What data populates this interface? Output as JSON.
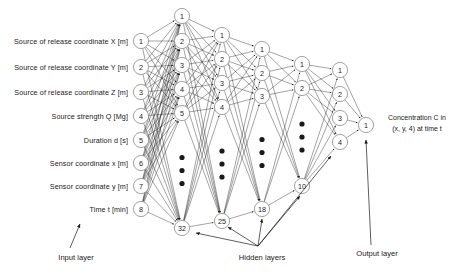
{
  "diagram": {
    "input_labels": [
      "Source of release coordinate X [m]",
      "Source of release coordinate Y [m]",
      "Source of release coordinate Z [m]",
      "Source strength Q [Mg]",
      "Duration d [s]",
      "Sensor coordinate x [m]",
      "Sensor coordinate y [m]",
      "Time t [min]"
    ],
    "output_label_line1": "Concentration C in",
    "output_label_line2": "(x, y, 4) at time t",
    "layer_captions": {
      "input": "Input layer",
      "hidden": "Hidden layers",
      "output": "Output layer"
    },
    "layers": [
      {
        "name": "input-layer",
        "x": 141,
        "node_labels": [
          "1",
          "2",
          "3",
          "4",
          "5",
          "6",
          "7",
          "8"
        ],
        "ellipsis": false,
        "ys": [
          41,
          67,
          92,
          116,
          140,
          163,
          186,
          209
        ]
      },
      {
        "name": "hidden-layer-1",
        "x": 182,
        "node_labels": [
          "1",
          "2",
          "3",
          "4",
          "5",
          "32"
        ],
        "ellipsis": true,
        "ys": [
          16,
          41,
          65,
          89,
          113,
          228
        ]
      },
      {
        "name": "hidden-layer-2",
        "x": 222,
        "node_labels": [
          "1",
          "2",
          "3",
          "4",
          "25"
        ],
        "ellipsis": true,
        "ys": [
          35,
          59,
          83,
          107,
          221
        ]
      },
      {
        "name": "hidden-layer-3",
        "x": 262,
        "node_labels": [
          "1",
          "2",
          "3",
          "18"
        ],
        "ellipsis": true,
        "ys": [
          49,
          73,
          96,
          209
        ]
      },
      {
        "name": "hidden-layer-4",
        "x": 302,
        "node_labels": [
          "1",
          "2",
          "10"
        ],
        "ellipsis": true,
        "ys": [
          64,
          88,
          186
        ]
      },
      {
        "name": "output-layer",
        "x": 340,
        "node_labels": [
          "1",
          "2",
          "3",
          "4"
        ],
        "ellipsis": false,
        "ys": [
          70,
          94,
          118,
          142
        ]
      },
      {
        "name": "final-output",
        "x": 366,
        "node_labels": [
          "1"
        ],
        "ellipsis": false,
        "ys": [
          125
        ]
      }
    ],
    "colors": {
      "stroke": "#1a1a1a",
      "node_stroke": "#8a8a8a",
      "text": "#222222"
    }
  }
}
